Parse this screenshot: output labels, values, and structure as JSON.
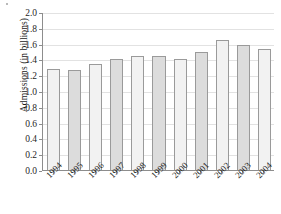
{
  "chart_data": {
    "type": "bar",
    "title": "",
    "xlabel": "",
    "ylabel": "Admissions (in billions)",
    "categories": [
      "1994",
      "1995",
      "1996",
      "1997",
      "1998",
      "1999",
      "2000",
      "2001",
      "2002",
      "2003",
      "2004"
    ],
    "values": [
      1.28,
      1.26,
      1.34,
      1.4,
      1.44,
      1.44,
      1.4,
      1.49,
      1.64,
      1.58,
      1.53
    ],
    "ylim": [
      0.0,
      2.0
    ],
    "ytick_labels": [
      "0.0",
      "0.2",
      "0.4",
      "0.6",
      "0.8",
      "1.0",
      "1.2",
      "1.4",
      "1.6",
      "1.8",
      "2.0"
    ],
    "ytick_values": [
      0.0,
      0.2,
      0.4,
      0.6,
      0.8,
      1.0,
      1.2,
      1.4,
      1.6,
      1.8,
      2.0
    ],
    "grid": true,
    "legend": "none",
    "bar_colors": [
      "#f2f2f2",
      "#dcdcdc"
    ],
    "bar_edge_color": "#9a9a9a",
    "grid_color": "#e2e2e2",
    "axis_color": "#8d8d8d",
    "text_color": "#1f1f1f",
    "background": "#ffffff"
  }
}
